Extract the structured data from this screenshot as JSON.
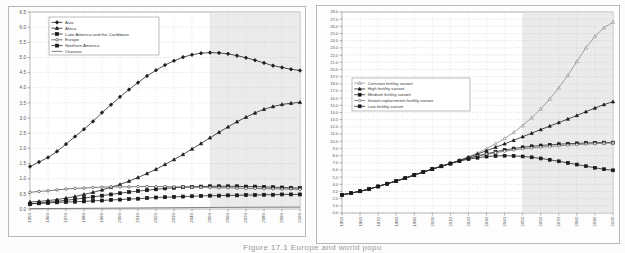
{
  "figure": {
    "caption": "Figure 17.1  Europe and world popu"
  },
  "chart_data": [
    {
      "id": "left",
      "type": "line",
      "title": "",
      "xlabel": "",
      "ylabel": "",
      "xlim": [
        1950,
        2100
      ],
      "ylim": [
        0.0,
        6.5
      ],
      "ytick_step": 0.5,
      "yticks": [
        "0.0",
        "0.5",
        "1.0",
        "1.5",
        "2.0",
        "2.5",
        "3.0",
        "3.5",
        "4.0",
        "4.5",
        "5.0",
        "5.5",
        "6.0",
        "6.5"
      ],
      "xticks": [
        "1950",
        "1960",
        "1970",
        "1980",
        "1990",
        "2000",
        "2010",
        "2020",
        "2030",
        "2040",
        "2050",
        "2060",
        "2070",
        "2080",
        "2090",
        "2100"
      ],
      "x": [
        1950,
        1955,
        1960,
        1965,
        1970,
        1975,
        1980,
        1985,
        1990,
        1995,
        2000,
        2005,
        2010,
        2015,
        2020,
        2025,
        2030,
        2035,
        2040,
        2045,
        2050,
        2055,
        2060,
        2065,
        2070,
        2075,
        2080,
        2085,
        2090,
        2095,
        2100
      ],
      "grid": true,
      "shaded_from": 2050,
      "legend_position": "top-left",
      "series": [
        {
          "name": "Asia",
          "marker": "diamond",
          "filled": true,
          "color": "#1a1a1a",
          "values": [
            1.4,
            1.55,
            1.7,
            1.9,
            2.14,
            2.39,
            2.63,
            2.89,
            3.18,
            3.44,
            3.7,
            3.94,
            4.17,
            4.39,
            4.58,
            4.75,
            4.89,
            5.01,
            5.09,
            5.14,
            5.16,
            5.15,
            5.12,
            5.06,
            4.99,
            4.91,
            4.82,
            4.73,
            4.67,
            4.61,
            4.57
          ]
        },
        {
          "name": "Africa",
          "marker": "triangle",
          "filled": true,
          "color": "#1a1a1a",
          "values": [
            0.23,
            0.25,
            0.28,
            0.31,
            0.36,
            0.41,
            0.48,
            0.55,
            0.63,
            0.72,
            0.81,
            0.92,
            1.04,
            1.17,
            1.31,
            1.47,
            1.63,
            1.8,
            1.98,
            2.16,
            2.35,
            2.53,
            2.71,
            2.88,
            3.03,
            3.17,
            3.29,
            3.38,
            3.45,
            3.49,
            3.52
          ]
        },
        {
          "name": "Latin America and the Caribbean",
          "marker": "square",
          "filled": true,
          "color": "#1a1a1a",
          "values": [
            0.17,
            0.19,
            0.22,
            0.25,
            0.29,
            0.32,
            0.36,
            0.4,
            0.44,
            0.48,
            0.52,
            0.56,
            0.59,
            0.62,
            0.65,
            0.68,
            0.7,
            0.72,
            0.73,
            0.74,
            0.75,
            0.75,
            0.75,
            0.75,
            0.74,
            0.74,
            0.73,
            0.72,
            0.71,
            0.7,
            0.69
          ]
        },
        {
          "name": "Europe",
          "marker": "circle",
          "filled": false,
          "color": "#4d4d4d",
          "values": [
            0.55,
            0.58,
            0.6,
            0.63,
            0.66,
            0.68,
            0.69,
            0.71,
            0.72,
            0.73,
            0.73,
            0.73,
            0.74,
            0.74,
            0.74,
            0.74,
            0.73,
            0.73,
            0.72,
            0.72,
            0.71,
            0.7,
            0.7,
            0.69,
            0.68,
            0.68,
            0.67,
            0.67,
            0.66,
            0.66,
            0.65
          ]
        },
        {
          "name": "Northern America",
          "marker": "square",
          "filled": true,
          "color": "#1a1a1a",
          "values": [
            0.17,
            0.19,
            0.2,
            0.22,
            0.23,
            0.24,
            0.25,
            0.27,
            0.28,
            0.3,
            0.31,
            0.33,
            0.34,
            0.36,
            0.38,
            0.39,
            0.4,
            0.41,
            0.42,
            0.43,
            0.44,
            0.44,
            0.45,
            0.45,
            0.46,
            0.46,
            0.47,
            0.47,
            0.48,
            0.48,
            0.48
          ]
        },
        {
          "name": "Oceania",
          "marker": "none",
          "filled": false,
          "color": "#5a5a5a",
          "values": [
            0.013,
            0.014,
            0.016,
            0.018,
            0.019,
            0.021,
            0.023,
            0.025,
            0.027,
            0.029,
            0.031,
            0.033,
            0.035,
            0.037,
            0.039,
            0.041,
            0.043,
            0.045,
            0.047,
            0.049,
            0.051,
            0.053,
            0.054,
            0.056,
            0.057,
            0.058,
            0.059,
            0.06,
            0.061,
            0.062,
            0.063
          ]
        }
      ]
    },
    {
      "id": "right",
      "type": "line",
      "title": "",
      "xlabel": "",
      "ylabel": "",
      "xlim": [
        1950,
        2100
      ],
      "ylim": [
        0.0,
        28.0
      ],
      "ytick_step": 1.0,
      "yticks": [
        "0.0",
        "1.0",
        "2.0",
        "3.0",
        "4.0",
        "5.0",
        "6.0",
        "7.0",
        "8.0",
        "9.0",
        "10.0",
        "11.0",
        "12.0",
        "13.0",
        "14.0",
        "15.0",
        "16.0",
        "17.0",
        "18.0",
        "19.0",
        "20.0",
        "21.0",
        "22.0",
        "23.0",
        "24.0",
        "25.0",
        "26.0",
        "27.0",
        "28.0"
      ],
      "xticks": [
        "1950",
        "1960",
        "1970",
        "1980",
        "1990",
        "2000",
        "2010",
        "2020",
        "2030",
        "2040",
        "2050",
        "2060",
        "2070",
        "2080",
        "2090",
        "2100"
      ],
      "x": [
        1950,
        1955,
        1960,
        1965,
        1970,
        1975,
        1980,
        1985,
        1990,
        1995,
        2000,
        2005,
        2010,
        2015,
        2020,
        2025,
        2030,
        2035,
        2040,
        2045,
        2050,
        2055,
        2060,
        2065,
        2070,
        2075,
        2080,
        2085,
        2090,
        2095,
        2100
      ],
      "grid": true,
      "shaded_from": 2050,
      "legend_position": "middle-left",
      "series": [
        {
          "name": "Constant fertility variant",
          "marker": "triangle",
          "filled": false,
          "color": "#8a8a8a",
          "values": [
            2.53,
            2.77,
            3.03,
            3.33,
            3.7,
            4.08,
            4.45,
            4.85,
            5.29,
            5.71,
            6.12,
            6.51,
            6.91,
            7.35,
            7.83,
            8.36,
            8.96,
            9.63,
            10.38,
            11.23,
            12.18,
            13.26,
            14.49,
            15.88,
            17.44,
            19.18,
            21.1,
            23.0,
            24.6,
            25.8,
            26.6
          ]
        },
        {
          "name": "High fertility variant",
          "marker": "triangle",
          "filled": true,
          "color": "#1a1a1a",
          "values": [
            2.53,
            2.77,
            3.03,
            3.33,
            3.7,
            4.08,
            4.45,
            4.85,
            5.29,
            5.71,
            6.12,
            6.51,
            6.9,
            7.32,
            7.76,
            8.21,
            8.68,
            9.15,
            9.63,
            10.12,
            10.62,
            11.12,
            11.62,
            12.11,
            12.6,
            13.09,
            13.58,
            14.1,
            14.62,
            15.1,
            15.5
          ]
        },
        {
          "name": "Medium fertility variant",
          "marker": "square",
          "filled": true,
          "color": "#1a1a1a",
          "values": [
            2.53,
            2.77,
            3.03,
            3.33,
            3.7,
            4.08,
            4.45,
            4.85,
            5.29,
            5.71,
            6.12,
            6.51,
            6.9,
            7.28,
            7.63,
            7.95,
            8.25,
            8.52,
            8.77,
            8.98,
            9.15,
            9.29,
            9.4,
            9.5,
            9.58,
            9.65,
            9.7,
            9.75,
            9.78,
            9.8,
            9.8
          ]
        },
        {
          "name": "Instant replacement fertility variant",
          "marker": "circle",
          "filled": false,
          "color": "#6a6a6a",
          "values": [
            2.53,
            2.77,
            3.03,
            3.33,
            3.7,
            4.08,
            4.45,
            4.85,
            5.29,
            5.71,
            6.12,
            6.51,
            6.9,
            7.27,
            7.6,
            7.9,
            8.17,
            8.4,
            8.6,
            8.78,
            8.93,
            9.05,
            9.16,
            9.26,
            9.35,
            9.44,
            9.52,
            9.6,
            9.66,
            9.72,
            9.76
          ]
        },
        {
          "name": "Low fertility variant",
          "marker": "square",
          "filled": true,
          "color": "#1a1a1a",
          "values": [
            2.53,
            2.77,
            3.03,
            3.33,
            3.7,
            4.08,
            4.45,
            4.85,
            5.29,
            5.71,
            6.12,
            6.51,
            6.88,
            7.22,
            7.5,
            7.7,
            7.86,
            7.95,
            7.98,
            7.95,
            7.88,
            7.76,
            7.6,
            7.41,
            7.2,
            6.98,
            6.75,
            6.52,
            6.3,
            6.1,
            5.95
          ]
        }
      ]
    }
  ]
}
